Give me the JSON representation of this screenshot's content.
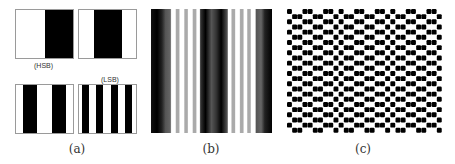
{
  "figure": {
    "panels": [
      {
        "id": "a",
        "caption": "(a)",
        "labels": {
          "hsb": "(HSB)",
          "lsb": "(LSB)"
        },
        "subpatterns": [
          {
            "name": "bit-plane-1",
            "periods": 1,
            "phase": "right-half-black"
          },
          {
            "name": "bit-plane-2",
            "periods": 1,
            "phase": "center-black"
          },
          {
            "name": "bit-plane-3",
            "periods": 2
          },
          {
            "name": "bit-plane-4",
            "periods": 4
          }
        ]
      },
      {
        "id": "b",
        "caption": "(b)",
        "description": "grayscale sinusoid-like vertical stripe pattern"
      },
      {
        "id": "c",
        "caption": "(c)",
        "description": "binary checkerboard / zigzag dot pattern"
      }
    ]
  }
}
